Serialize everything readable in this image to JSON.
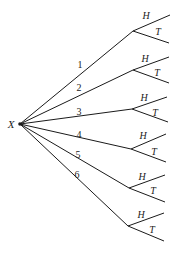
{
  "diagram": {
    "type": "tree",
    "root": {
      "label": "X",
      "x": 20,
      "y": 124
    },
    "line_color": "#1a1a1a",
    "text_color": "#222222",
    "branches": [
      {
        "label": "1",
        "node": [
          133,
          31
        ],
        "label_pos": [
          80,
          68
        ],
        "outcomes": [
          {
            "label": "H",
            "end": [
              170,
              15
            ],
            "label_pos": [
              146,
              19
            ]
          },
          {
            "label": "T",
            "end": [
              169,
              43
            ],
            "label_pos": [
              158,
              35
            ]
          }
        ]
      },
      {
        "label": "2",
        "node": [
          133,
          70
        ],
        "label_pos": [
          79,
          91
        ],
        "outcomes": [
          {
            "label": "H",
            "end": [
              169,
              57
            ],
            "label_pos": [
              145,
              62
            ]
          },
          {
            "label": "T",
            "end": [
              169,
              83
            ],
            "label_pos": [
              157,
              76
            ]
          }
        ]
      },
      {
        "label": "3",
        "node": [
          132,
          109
        ],
        "label_pos": [
          79,
          115
        ],
        "outcomes": [
          {
            "label": "H",
            "end": [
              167,
              97
            ],
            "label_pos": [
              144,
              101
            ]
          },
          {
            "label": "T",
            "end": [
              168,
              122
            ],
            "label_pos": [
              155,
              116
            ]
          }
        ]
      },
      {
        "label": "4",
        "node": [
          131,
          149
        ],
        "label_pos": [
          79,
          138
        ],
        "outcomes": [
          {
            "label": "H",
            "end": [
              166,
              134
            ],
            "label_pos": [
              143,
              139
            ]
          },
          {
            "label": "T",
            "end": [
              166,
              162
            ],
            "label_pos": [
              154,
              155
            ]
          }
        ]
      },
      {
        "label": "5",
        "node": [
          129,
          188
        ],
        "label_pos": [
          78,
          158
        ],
        "outcomes": [
          {
            "label": "H",
            "end": [
              165,
              175
            ],
            "label_pos": [
              142,
              180
            ]
          },
          {
            "label": "T",
            "end": [
              165,
              202
            ],
            "label_pos": [
              153,
              194
            ]
          }
        ]
      },
      {
        "label": "6",
        "node": [
          128,
          226
        ],
        "label_pos": [
          77,
          178
        ],
        "outcomes": [
          {
            "label": "H",
            "end": [
              164,
              213
            ],
            "label_pos": [
              141,
              218
            ]
          },
          {
            "label": "T",
            "end": [
              164,
              241
            ],
            "label_pos": [
              152,
              233
            ]
          }
        ]
      }
    ]
  }
}
